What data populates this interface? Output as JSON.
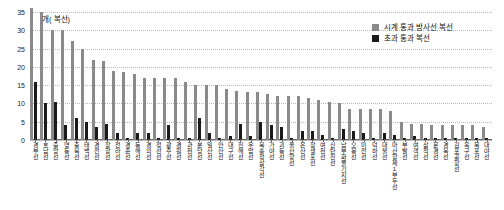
{
  "chart_data": {
    "type": "bar",
    "title": "",
    "subtitle": "",
    "unit_label": "개( 복선)",
    "xlabel": "",
    "ylabel": "",
    "ylim": [
      0,
      35
    ],
    "yticks": [
      0,
      5,
      10,
      15,
      20,
      25,
      30,
      35
    ],
    "ytick_labels": [
      "0",
      "5",
      "10",
      "15",
      "20",
      "25",
      "30",
      "35"
    ],
    "grid": true,
    "legend_position": "top-right",
    "series": [
      {
        "name": "시계 통과 방사선 복선",
        "color": "#8a8a8a",
        "values": [
          36,
          35,
          30,
          30,
          27,
          25,
          22,
          21.5,
          19,
          18.5,
          18,
          17,
          17,
          17,
          17,
          16,
          15,
          15,
          15,
          14,
          13.5,
          13,
          13,
          12.5,
          12,
          12,
          12,
          11.5,
          11,
          10.5,
          10,
          8.5,
          8.5,
          8.5,
          8.5,
          8,
          5,
          4.5,
          4.5,
          4,
          4,
          4,
          4,
          4,
          3.5
        ]
      },
      {
        "name": "초과 통과 복선",
        "color": "#1a1a1a",
        "values": [
          16,
          10,
          10.5,
          4,
          6,
          5,
          3.5,
          4.5,
          2,
          0.5,
          2,
          2,
          0.5,
          4,
          0.5,
          0.5,
          6,
          2,
          0.5,
          1,
          4.5,
          1,
          5,
          4,
          3.5,
          0.5,
          2.5,
          2.5,
          1.5,
          0.5,
          3,
          2.5,
          2,
          0.5,
          2,
          1.5,
          0.5,
          1,
          0.5,
          0.5,
          0.5,
          0.5,
          0.5,
          0.5,
          0.5
        ]
      }
    ],
    "categories": [
      "경부선",
      "호남선",
      "중앙선",
      "영동선",
      "충북선",
      "태백선",
      "경전선",
      "장항선",
      "전라선",
      "경춘선",
      "동해선",
      "경의선",
      "정선선",
      "광주선",
      "경원선",
      "과천선",
      "분당선",
      "일산선",
      "안산선",
      "대구선",
      "진해선",
      "우암선",
      "북송정삼각선",
      "가야선",
      "괴동선",
      "울산항선",
      "온산선",
      "장생포선",
      "여천선",
      "신탄진선",
      "남부화물기지선",
      "오봉선",
      "미전선",
      "덕하선",
      "대불선",
      "마산항제1부두선",
      "부발선",
      "여객선",
      "삼척선",
      "문경선",
      "경북선",
      "김포공항선",
      "옥구선",
      "목포선",
      "대야선"
    ]
  },
  "legend": {
    "items": [
      {
        "label": "시계 통과 방사선 복선",
        "swatch": "gray"
      },
      {
        "label": "초과 통과 복선",
        "swatch": "black"
      }
    ]
  },
  "axis": {
    "unit_note": "개( 복선)"
  }
}
